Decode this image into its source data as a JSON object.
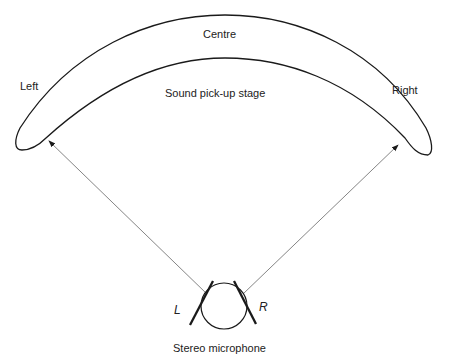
{
  "diagram": {
    "stage": {
      "centre_label": "Centre",
      "left_label": "Left",
      "right_label": "Right",
      "stage_label": "Sound pick-up stage"
    },
    "microphone": {
      "left_capsule_label": "L",
      "right_capsule_label": "R",
      "caption": "Stereo microphone"
    },
    "colors": {
      "stroke": "#1a1a1a",
      "arrow": "#777777",
      "text": "#222222"
    }
  }
}
